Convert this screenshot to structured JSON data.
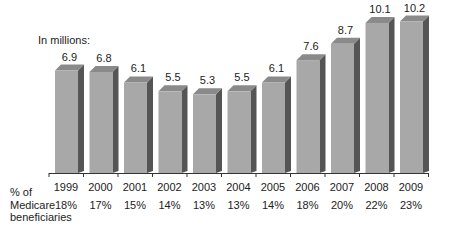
{
  "chart_data": {
    "type": "bar",
    "title": "",
    "unit_label": "In millions:",
    "xlabel": "",
    "ylabel": "In millions",
    "categories": [
      "1999",
      "2000",
      "2001",
      "2002",
      "2003",
      "2004",
      "2005",
      "2006",
      "2007",
      "2008",
      "2009"
    ],
    "values": [
      6.9,
      6.8,
      6.1,
      5.5,
      5.3,
      5.5,
      6.1,
      7.6,
      8.7,
      10.1,
      10.2
    ],
    "data_labels": [
      "6.9",
      "6.8",
      "6.1",
      "5.5",
      "5.3",
      "5.5",
      "6.1",
      "7.6",
      "8.7",
      "10.1",
      "10.2"
    ],
    "secondary_row": {
      "label": "% of Medicare beneficiaries",
      "label_lines": [
        "% of",
        "Medicare",
        "beneficiaries"
      ],
      "values": [
        "18%",
        "17%",
        "15%",
        "14%",
        "13%",
        "13%",
        "14%",
        "18%",
        "20%",
        "22%",
        "23%"
      ]
    },
    "style": "3d-bar",
    "grid": false,
    "legend": null,
    "colors": {
      "front": "#a8a8a8",
      "side": "#555555",
      "top": "#8a8a8a",
      "axis": "#333333"
    }
  }
}
